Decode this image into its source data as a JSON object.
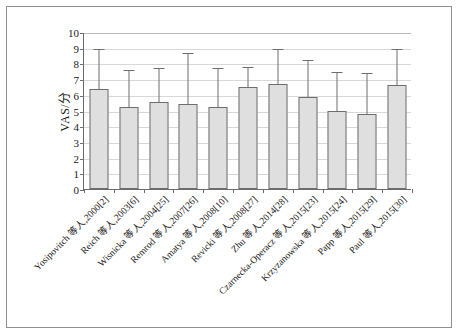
{
  "chart_data": {
    "type": "bar",
    "title": "",
    "subtitle": "",
    "xlabel": "",
    "ylabel": "VAS/分",
    "ylim": [
      0,
      10
    ],
    "yticks": [
      0,
      1,
      2,
      3,
      4,
      5,
      6,
      7,
      8,
      9,
      10
    ],
    "ytick_labels": [
      "0",
      "1",
      "2",
      "3",
      "4",
      "5",
      "6",
      "7",
      "8",
      "9",
      "10"
    ],
    "grid": true,
    "legend": "none",
    "error_bars": "upper-only",
    "bar_fill_color": "#dfdfdf",
    "bar_edge_color": "#6e6e6e",
    "gridline_color": "#d8d8d8",
    "axis_color": "#6b6b6b",
    "frame_color": "#8f8f8f",
    "categories": [
      "Yosipovitch 等人,2000[2]",
      "Reich 等人,2003[6]",
      "Wisnicka 等人,2004[25]",
      "Remrod 等人,2007[26]",
      "Amatya 等人,2008[10]",
      "Revicki 等人,2008[27]",
      "Zhu 等人,2014[28]",
      "Czarnecka-Operacz 等人,2015[23]",
      "Krzyzanowska 等人,2015[24]",
      "Papp 等人,2015[29]",
      "Paul 等人,2015[30]"
    ],
    "values": [
      6.4,
      5.25,
      5.55,
      5.4,
      5.25,
      6.5,
      6.7,
      5.85,
      5.0,
      4.8,
      6.6
    ],
    "error_upper": [
      9.0,
      7.65,
      7.75,
      8.7,
      7.8,
      7.85,
      9.0,
      8.25,
      7.5,
      7.45,
      8.95
    ],
    "series": [
      {
        "name": "VAS",
        "values": [
          6.4,
          5.25,
          5.55,
          5.4,
          5.25,
          6.5,
          6.7,
          5.85,
          5.0,
          4.8,
          6.6
        ]
      }
    ]
  }
}
